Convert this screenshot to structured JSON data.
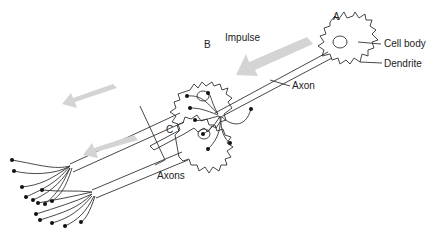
{
  "diagram": {
    "labels": {
      "neuron_a": "A",
      "neuron_b": "B",
      "neuron_c": "C",
      "impulse": "Impulse",
      "cell_body": "Cell body",
      "dendrite": "Dendrite",
      "axon": "Axon",
      "axons": "Axons"
    },
    "colors": {
      "line": "#333333",
      "arrow_fill": "#d4d4d4",
      "terminal": "#111111"
    },
    "arrows": [
      {
        "name": "impulse-arrow-top",
        "direction": "down-left"
      },
      {
        "name": "impulse-arrow-b",
        "direction": "left"
      },
      {
        "name": "impulse-arrow-c",
        "direction": "left"
      }
    ]
  }
}
